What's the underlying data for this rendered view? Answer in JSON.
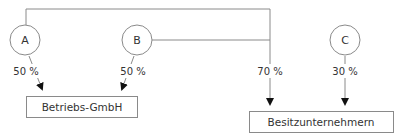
{
  "diagram": {
    "shareholders": [
      {
        "id": "A",
        "label": "A"
      },
      {
        "id": "B",
        "label": "B"
      },
      {
        "id": "C",
        "label": "C"
      }
    ],
    "companies": [
      {
        "id": "betriebs",
        "label": "Betriebs-GmbH"
      },
      {
        "id": "besitz",
        "label": "Besitzunternehmern"
      }
    ],
    "edges": [
      {
        "from": "A",
        "to": "betriebs",
        "label": "50 %"
      },
      {
        "from": "B",
        "to": "betriebs",
        "label": "50 %"
      },
      {
        "from": "A+B",
        "to": "besitz",
        "label": "70 %"
      },
      {
        "from": "C",
        "to": "besitz",
        "label": "30 %"
      }
    ],
    "colors": {
      "line": "#8a8a8a",
      "arrow": "#111111",
      "text": "#333333"
    }
  }
}
